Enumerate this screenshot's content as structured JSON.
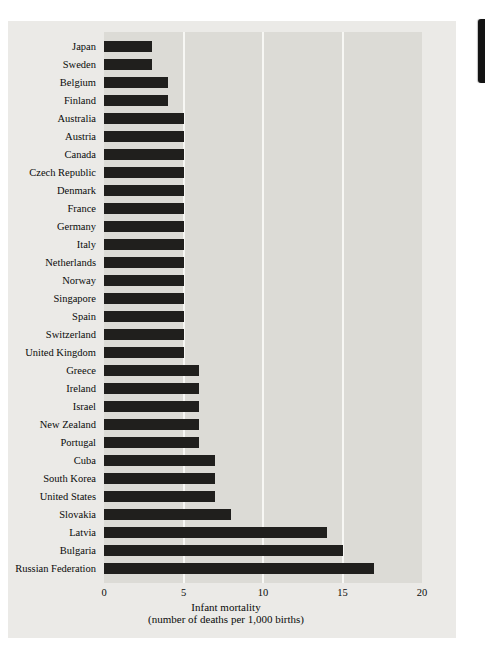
{
  "chart_data": {
    "type": "bar",
    "orientation": "horizontal",
    "title": "",
    "xlabel_line1": "Infant mortality",
    "xlabel_line2": "(number of deaths per 1,000 births)",
    "xlim": [
      0,
      20
    ],
    "xticks": [
      "0",
      "5",
      "10",
      "15",
      "20"
    ],
    "xtick_values": [
      0,
      5,
      10,
      15,
      20
    ],
    "gridline_values": [
      5,
      10,
      15
    ],
    "grid": "vertical white gridlines",
    "legend": "none",
    "categories": [
      "Japan",
      "Sweden",
      "Belgium",
      "Finland",
      "Australia",
      "Austria",
      "Canada",
      "Czech Republic",
      "Denmark",
      "France",
      "Germany",
      "Italy",
      "Netherlands",
      "Norway",
      "Singapore",
      "Spain",
      "Switzerland",
      "United Kingdom",
      "Greece",
      "Ireland",
      "Israel",
      "New Zealand",
      "Portugal",
      "Cuba",
      "South Korea",
      "United States",
      "Slovakia",
      "Latvia",
      "Bulgaria",
      "Russian Federation"
    ],
    "values": [
      3,
      3,
      4,
      4,
      5,
      5,
      5,
      5,
      5,
      5,
      5,
      5,
      5,
      5,
      5,
      5,
      5,
      5,
      6,
      6,
      6,
      6,
      6,
      7,
      7,
      7,
      8,
      14,
      15,
      17
    ],
    "colors": {
      "bar": "#201f1d",
      "plot_bg": "#dcdbd6",
      "figure_bg": "#ebeae7",
      "gridline": "#f7f7f4",
      "text": "#0a0a0a",
      "page_bg": "#ffffff",
      "edge_mark": "#131313"
    }
  },
  "page_artifacts": {
    "edge_ink_mark": "black ink mark on right page edge"
  }
}
